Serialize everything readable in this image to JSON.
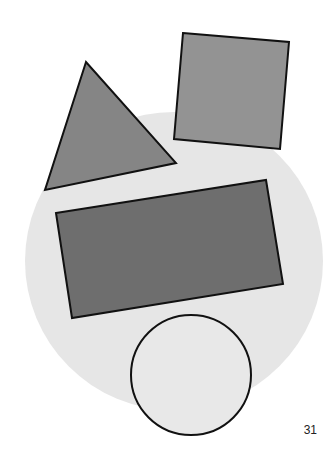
{
  "page": {
    "number": "31",
    "background": "#ffffff"
  },
  "shapes": {
    "big_circle": {
      "type": "circle",
      "cx": 174,
      "cy": 261,
      "r": 149,
      "fill": "#e6e6e6",
      "outline": false
    },
    "triangle": {
      "type": "triangle",
      "points": "86,62 45,190 176,163",
      "fill": "#858585",
      "stroke": "#111111"
    },
    "square": {
      "type": "square",
      "points": "183,33 289,42 280,149 174,139",
      "fill": "#939393",
      "stroke": "#111111"
    },
    "rectangle": {
      "type": "rectangle",
      "points": "56,213 266,180 283,284 72,318",
      "fill": "#6e6e6e",
      "stroke": "#111111"
    },
    "small_circle": {
      "type": "circle",
      "cx": 191,
      "cy": 375,
      "r": 60,
      "fill": "#e8e8e8",
      "stroke": "#111111"
    }
  }
}
